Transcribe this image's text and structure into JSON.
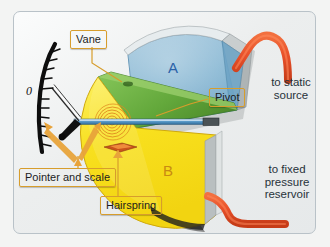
{
  "figure": {
    "background_color": "#f3f4f3",
    "frame_color": "#b9c2c8"
  },
  "chambers": [
    {
      "id": "A",
      "letter": "A",
      "color": "#7fb2d0",
      "name": "chamber-a"
    },
    {
      "id": "B",
      "letter": "B",
      "color": "#f8e01e",
      "name": "chamber-b"
    }
  ],
  "scale": {
    "zero_label": "0",
    "tick_count": 13,
    "arc_color": "#111111"
  },
  "callouts": [
    {
      "id": "vane",
      "label": "Vane",
      "box": true
    },
    {
      "id": "pivot",
      "label": "Pivot",
      "box": true
    },
    {
      "id": "pointer",
      "label": "Pointer and scale",
      "box": true
    },
    {
      "id": "hairspring",
      "label": "Hairspring",
      "box": true
    }
  ],
  "annotations": {
    "static_source": "to static\nsource",
    "static_source_line1": "to static",
    "static_source_line2": "source",
    "fixed_reservoir_line1": "to fixed",
    "fixed_reservoir_line2": "pressure",
    "fixed_reservoir_line3": "reservoir"
  },
  "colors": {
    "callout_fill": "#ffcf72",
    "callout_border": "#d79d2c",
    "tube": "#e8502a",
    "vane_green": "#63a83b",
    "hairspring": "#e08a1e",
    "pointer": "#111111",
    "chamber_a": "#7fb2d0",
    "chamber_b": "#f8e01e",
    "casing": "#d8dbdb",
    "text": "#27323a"
  }
}
